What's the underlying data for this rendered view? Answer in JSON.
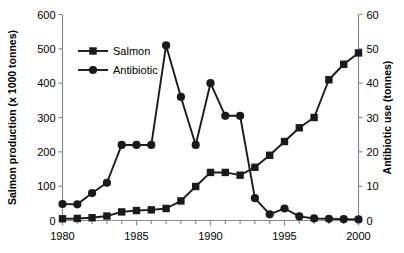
{
  "chart_data": {
    "type": "line",
    "title": "",
    "xlabel": "",
    "ylabel": "Salmon production (x 1000 tonnes)",
    "y2label": "Antibiotic use (tonnes)",
    "x": [
      1980,
      1981,
      1982,
      1983,
      1984,
      1985,
      1986,
      1987,
      1988,
      1989,
      1990,
      1991,
      1992,
      1993,
      1994,
      1995,
      1996,
      1997,
      1998,
      1999,
      2000
    ],
    "xlim": [
      1980,
      2000
    ],
    "xticks": [
      1980,
      1985,
      1990,
      1995,
      2000
    ],
    "xtick_labels": [
      "1980",
      "1985",
      "1990",
      "1995",
      "2000"
    ],
    "ylim": [
      0,
      600
    ],
    "yticks": [
      0,
      100,
      200,
      300,
      400,
      500,
      600
    ],
    "ytick_labels": [
      "0",
      "100",
      "200",
      "300",
      "400",
      "500",
      "600"
    ],
    "y2lim": [
      0,
      60
    ],
    "y2ticks": [
      0,
      10,
      20,
      30,
      40,
      50,
      60
    ],
    "y2tick_labels": [
      "0",
      "10",
      "20",
      "30",
      "40",
      "50",
      "60"
    ],
    "grid": false,
    "legend_position": "upper-left",
    "series": [
      {
        "name": "Salmon",
        "axis": "left",
        "marker": "square",
        "color": "#1a1a1a",
        "units": "x 1000 tonnes",
        "values": [
          5,
          6,
          8,
          13,
          25,
          29,
          31,
          35,
          57,
          99,
          140,
          140,
          132,
          155,
          190,
          230,
          270,
          300,
          410,
          455,
          488
        ]
      },
      {
        "name": "Antibiotic",
        "axis": "right",
        "marker": "circle",
        "color": "#1a1a1a",
        "units": "tonnes",
        "values": [
          4.8,
          4.7,
          8.0,
          11.0,
          22.0,
          22.0,
          22.0,
          51.0,
          36.0,
          22.0,
          40.0,
          30.5,
          30.5,
          6.5,
          1.8,
          3.5,
          1.2,
          0.6,
          0.5,
          0.4,
          0.3
        ]
      }
    ],
    "annotations": []
  },
  "legend": {
    "entries": [
      {
        "label": "Salmon",
        "marker": "square"
      },
      {
        "label": "Antibiotic",
        "marker": "circle"
      }
    ]
  }
}
